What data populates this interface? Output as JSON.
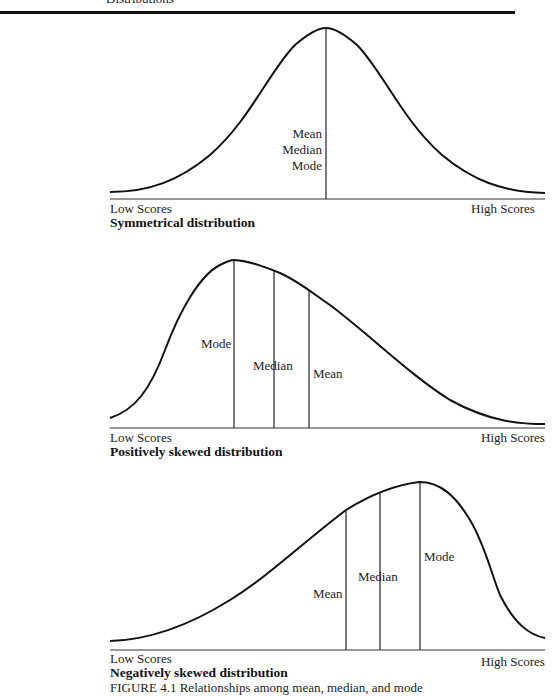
{
  "header": {
    "running_title": "Distributions"
  },
  "axis": {
    "low_label": "Low Scores",
    "high_label": "High Scores"
  },
  "panels": [
    {
      "title": "Symmetrical distribution",
      "labels": {
        "mean": "Mean",
        "median": "Median",
        "mode": "Mode"
      }
    },
    {
      "title": "Positively skewed distribution",
      "labels": {
        "mode": "Mode",
        "median": "Median",
        "mean": "Mean"
      }
    },
    {
      "title": "Negatively skewed distribution",
      "labels": {
        "mean": "Mean",
        "median": "Median",
        "mode": "Mode"
      }
    }
  ],
  "caption": {
    "text": "FIGURE 4.1 Relationships among mean, median, and mode"
  },
  "colors": {
    "ink": "#111111",
    "background": "#ffffff"
  }
}
